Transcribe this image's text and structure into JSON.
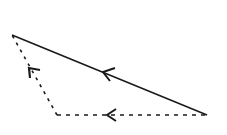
{
  "diagram": {
    "type": "vector-triangle",
    "stroke_color": "#1a1a1a",
    "background": "#ffffff",
    "vertices": {
      "A": {
        "x": 12,
        "y": 35
      },
      "B": {
        "x": 207,
        "y": 115
      },
      "C": {
        "x": 57,
        "y": 115
      }
    },
    "edges": [
      {
        "name": "resultant",
        "from": "B",
        "to": "A",
        "style": "solid",
        "arrow": "left-up"
      },
      {
        "name": "horizontal",
        "from": "B",
        "to": "C",
        "style": "dashed",
        "arrow": "left"
      },
      {
        "name": "diagonal",
        "from": "C",
        "to": "A",
        "style": "dashed",
        "arrow": "up-left"
      }
    ]
  }
}
